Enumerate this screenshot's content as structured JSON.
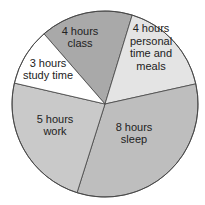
{
  "chart_data": {
    "type": "pie",
    "title": "",
    "unit": "hours",
    "total": 24,
    "slices": [
      {
        "key": "class",
        "hours": 4,
        "label_lines": [
          "4 hours",
          "class"
        ],
        "color": "#a9a9a9",
        "start_deg": -131,
        "end_deg": -73,
        "label_pos": [
          80,
          37
        ]
      },
      {
        "key": "personal",
        "hours": 4,
        "label_lines": [
          "4 hours",
          "personal",
          "time and",
          "meals"
        ],
        "color": "#e4e4e4",
        "start_deg": -73,
        "end_deg": -12.5,
        "label_pos": [
          151,
          47
        ]
      },
      {
        "key": "sleep",
        "hours": 8,
        "label_lines": [
          "8 hours",
          "sleep"
        ],
        "color": "#bebebe",
        "start_deg": -12.5,
        "end_deg": 107.5,
        "label_pos": [
          134,
          133
        ]
      },
      {
        "key": "work",
        "hours": 5,
        "label_lines": [
          "5 hours",
          "work"
        ],
        "color": "#c9c9c9",
        "start_deg": 107.5,
        "end_deg": 193,
        "label_pos": [
          55,
          125
        ]
      },
      {
        "key": "study",
        "hours": 3,
        "label_lines": [
          "3 hours",
          "study time"
        ],
        "color": "#ffffff",
        "start_deg": 193,
        "end_deg": 229,
        "label_pos": [
          48,
          69
        ]
      }
    ],
    "labels": [
      "4 hours class",
      "4 hours personal time and meals",
      "8 hours sleep",
      "5 hours work",
      "3 hours study time"
    ],
    "values": [
      4,
      4,
      8,
      5,
      3
    ],
    "legend": "none (labels inside slices)"
  },
  "geometry": {
    "cx": 105,
    "cy": 104,
    "r": 93
  }
}
